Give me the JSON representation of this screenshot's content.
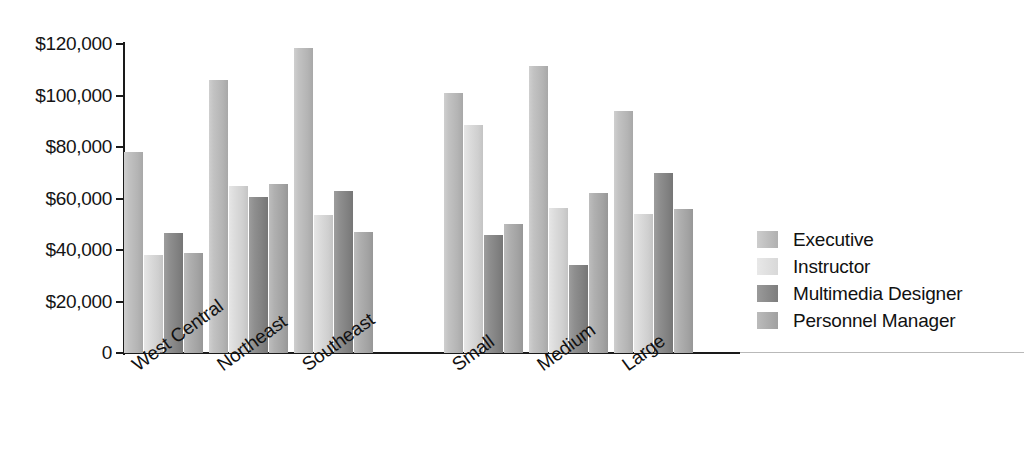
{
  "chart_data": {
    "type": "bar",
    "title": "",
    "subtitle": "",
    "xlabel": "",
    "ylabel": "",
    "ylim": [
      0,
      120000
    ],
    "grid": false,
    "legend_position": "right",
    "orientation": "vertical",
    "grouping": "grouped",
    "value_prefix": "$",
    "categories": [
      "West Central",
      "Northeast",
      "Southeast",
      "Small",
      "Medium",
      "Large"
    ],
    "category_group_break_after": "Southeast",
    "ytick_labels": [
      "$120,000",
      "$100,000",
      "$80,000",
      "$60,000",
      "$40,000",
      "$20,000",
      "0"
    ],
    "ytick_values": [
      120000,
      100000,
      80000,
      60000,
      40000,
      20000,
      0
    ],
    "series": [
      {
        "name": "Executive",
        "color": "#bdbdbd",
        "values": [
          78000,
          106000,
          118500,
          101000,
          111500,
          94000
        ]
      },
      {
        "name": "Instructor",
        "color": "#dcdcdc",
        "values": [
          38000,
          65000,
          53500,
          88500,
          56500,
          54000
        ]
      },
      {
        "name": "Multimedia Designer",
        "color": "#8a8a8a",
        "values": [
          46500,
          60500,
          63000,
          46000,
          34000,
          70000
        ]
      },
      {
        "name": "Personnel Manager",
        "color": "#ababab",
        "values": [
          38800,
          65500,
          47000,
          50000,
          62000,
          56000
        ]
      }
    ]
  }
}
